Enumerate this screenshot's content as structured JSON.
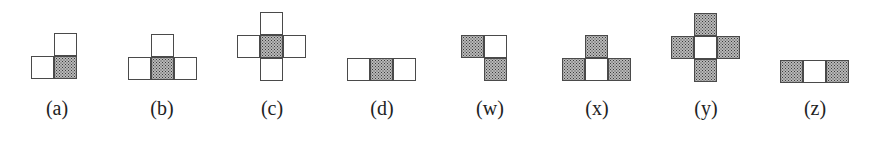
{
  "figures": [
    {
      "id": "a",
      "label": "(a)",
      "label_x": 57,
      "cells": [
        {
          "x": 54,
          "y": 33,
          "shaded": false
        },
        {
          "x": 31,
          "y": 56,
          "shaded": false
        },
        {
          "x": 54,
          "y": 56,
          "shaded": true
        }
      ]
    },
    {
      "id": "b",
      "label": "(b)",
      "label_x": 162,
      "cells": [
        {
          "x": 151,
          "y": 34,
          "shaded": false
        },
        {
          "x": 128,
          "y": 57,
          "shaded": false
        },
        {
          "x": 151,
          "y": 57,
          "shaded": true
        },
        {
          "x": 174,
          "y": 57,
          "shaded": false
        }
      ]
    },
    {
      "id": "c",
      "label": "(c)",
      "label_x": 272,
      "cells": [
        {
          "x": 260,
          "y": 12,
          "shaded": false
        },
        {
          "x": 237,
          "y": 35,
          "shaded": false
        },
        {
          "x": 260,
          "y": 35,
          "shaded": true
        },
        {
          "x": 283,
          "y": 35,
          "shaded": false
        },
        {
          "x": 260,
          "y": 58,
          "shaded": false
        }
      ]
    },
    {
      "id": "d",
      "label": "(d)",
      "label_x": 382,
      "cells": [
        {
          "x": 347,
          "y": 58,
          "shaded": false
        },
        {
          "x": 370,
          "y": 58,
          "shaded": true
        },
        {
          "x": 393,
          "y": 58,
          "shaded": false
        }
      ]
    },
    {
      "id": "w",
      "label": "(w)",
      "label_x": 490,
      "cells": [
        {
          "x": 461,
          "y": 35,
          "shaded": true
        },
        {
          "x": 484,
          "y": 35,
          "shaded": false
        },
        {
          "x": 484,
          "y": 58,
          "shaded": true
        }
      ]
    },
    {
      "id": "x",
      "label": "(x)",
      "label_x": 597,
      "cells": [
        {
          "x": 585,
          "y": 35,
          "shaded": true
        },
        {
          "x": 562,
          "y": 58,
          "shaded": true
        },
        {
          "x": 585,
          "y": 58,
          "shaded": false
        },
        {
          "x": 608,
          "y": 58,
          "shaded": true
        }
      ]
    },
    {
      "id": "y",
      "label": "(y)",
      "label_x": 706,
      "cells": [
        {
          "x": 694,
          "y": 13,
          "shaded": true
        },
        {
          "x": 671,
          "y": 36,
          "shaded": true
        },
        {
          "x": 694,
          "y": 36,
          "shaded": false
        },
        {
          "x": 717,
          "y": 36,
          "shaded": true
        },
        {
          "x": 694,
          "y": 59,
          "shaded": true
        }
      ]
    },
    {
      "id": "z",
      "label": "(z)",
      "label_x": 815,
      "cells": [
        {
          "x": 780,
          "y": 60,
          "shaded": true
        },
        {
          "x": 803,
          "y": 60,
          "shaded": false
        },
        {
          "x": 826,
          "y": 60,
          "shaded": true
        }
      ]
    }
  ],
  "style": {
    "border_color": "#4a4a4a",
    "shade_color": "#8a8a8a",
    "background": "#ffffff"
  }
}
